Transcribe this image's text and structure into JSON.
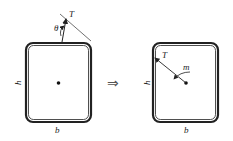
{
  "diagram": {
    "left_section": {
      "labels": {
        "height": "h",
        "width": "b",
        "force": "T",
        "angle": "θ"
      }
    },
    "equivalence_symbol": "⇒",
    "right_section": {
      "labels": {
        "height": "h",
        "width": "b",
        "force": "T",
        "moment": "m"
      }
    },
    "colors": {
      "stroke": "#222222",
      "background": "#ffffff"
    }
  }
}
